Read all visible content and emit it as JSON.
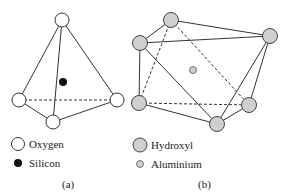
{
  "panel_a": {
    "caption": "(a)",
    "legend": [
      {
        "label": "Oxygen",
        "symbol": "white-circle"
      },
      {
        "label": "Silicon",
        "symbol": "black-dot"
      }
    ]
  },
  "panel_b": {
    "caption": "(b)",
    "legend": [
      {
        "label": "Hydroxyl",
        "symbol": "gray-circle"
      },
      {
        "label": "Aluminium",
        "symbol": "small-gray-dot"
      }
    ]
  },
  "colors": {
    "line": "#333333",
    "oxygen_fill": "#ffffff",
    "silicon_fill": "#111111",
    "hydroxyl_fill": "#cfcfcf",
    "aluminium_fill": "#cfcfcf"
  }
}
